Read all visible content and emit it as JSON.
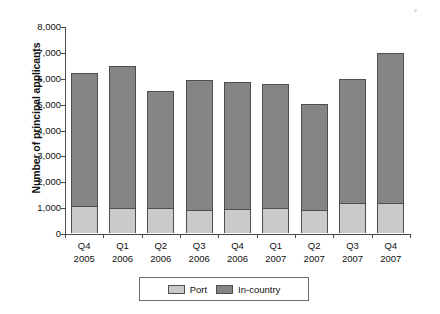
{
  "chart_data": {
    "type": "bar",
    "subtype": "stacked-vertical",
    "title": "",
    "xlabel": "",
    "ylabel": "Number of principal applicants",
    "ylim": [
      0,
      8000
    ],
    "ytick_step": 1000,
    "ytick_labels": [
      "8,000",
      "7,000",
      "6,000",
      "5,000",
      "4,000",
      "3,000",
      "2,000",
      "1,000",
      "0"
    ],
    "ytick_values": [
      8000,
      7000,
      6000,
      5000,
      4000,
      3000,
      2000,
      1000,
      0
    ],
    "grid": false,
    "legend_position": "bottom",
    "categories": [
      "Q4 2005",
      "Q1 2006",
      "Q2 2006",
      "Q3 2006",
      "Q4 2006",
      "Q1 2007",
      "Q2 2007",
      "Q3 2007",
      "Q4 2007"
    ],
    "category_lines": [
      {
        "quarter": "Q4",
        "year": "2005"
      },
      {
        "quarter": "Q1",
        "year": "2006"
      },
      {
        "quarter": "Q2",
        "year": "2006"
      },
      {
        "quarter": "Q3",
        "year": "2006"
      },
      {
        "quarter": "Q4",
        "year": "2006"
      },
      {
        "quarter": "Q1",
        "year": "2007"
      },
      {
        "quarter": "Q2",
        "year": "2007"
      },
      {
        "quarter": "Q3",
        "year": "2007"
      },
      {
        "quarter": "Q4",
        "year": "2007"
      }
    ],
    "series": [
      {
        "name": "Port",
        "color": "#cacaca",
        "values": [
          1050,
          980,
          950,
          880,
          930,
          950,
          900,
          1150,
          1150
        ]
      },
      {
        "name": "In-country",
        "color": "#858585",
        "values": [
          5150,
          5470,
          4550,
          5020,
          4920,
          4800,
          4100,
          4800,
          5800
        ]
      }
    ],
    "totals": [
      6200,
      6450,
      5500,
      5900,
      5850,
      5750,
      5000,
      5950,
      6950
    ]
  },
  "legend": {
    "items": [
      {
        "label": "Port",
        "color": "#cacaca"
      },
      {
        "label": "In-country",
        "color": "#858585"
      }
    ]
  }
}
